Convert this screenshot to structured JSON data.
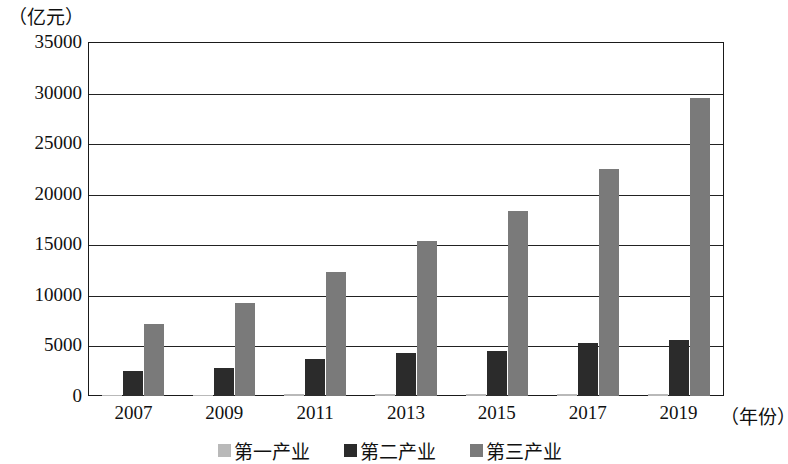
{
  "chart_data": {
    "type": "bar",
    "title": "",
    "subtitle": "",
    "unit_label": "（亿元）",
    "xlabel": "（年份）",
    "ylabel": "",
    "categories": [
      "2007",
      "2009",
      "2011",
      "2013",
      "2015",
      "2017",
      "2019"
    ],
    "series": [
      {
        "name": "第一产业",
        "color": "#b9b9b9",
        "values": [
          120,
          130,
          150,
          170,
          180,
          190,
          200
        ]
      },
      {
        "name": "第二产业",
        "color": "#2b2b2b",
        "values": [
          2470,
          2800,
          3700,
          4300,
          4450,
          5200,
          5550
        ]
      },
      {
        "name": "第三产业",
        "color": "#7a7a7a",
        "values": [
          7150,
          9200,
          12300,
          15300,
          18300,
          22400,
          29500
        ]
      }
    ],
    "yticks": [
      0,
      5000,
      10000,
      15000,
      20000,
      25000,
      30000,
      35000
    ],
    "ytick_labels": [
      "0",
      "5000",
      "10000",
      "15000",
      "20000",
      "25000",
      "30000",
      "35000"
    ],
    "ylim": [
      0,
      35000
    ],
    "grid": true,
    "legend_position": "bottom",
    "axis_color": "#1a1a1a"
  }
}
